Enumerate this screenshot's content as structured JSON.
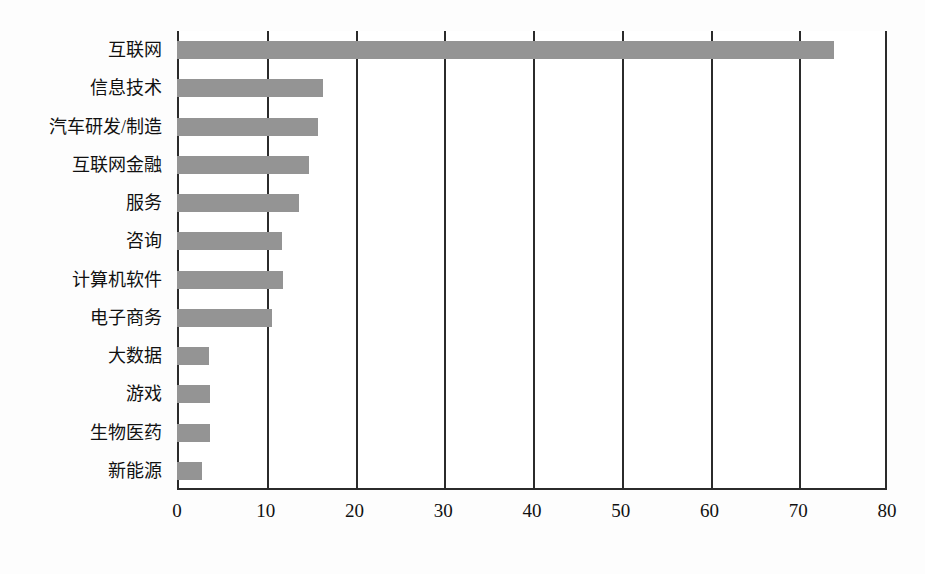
{
  "chart_data": {
    "type": "bar",
    "orientation": "horizontal",
    "title": "",
    "xlabel": "",
    "ylabel": "",
    "xlim": [
      0,
      80
    ],
    "ylim": null,
    "grid": true,
    "legend": null,
    "bar_color": "#949494",
    "axis_color": "#2b2b2b",
    "background_color": "#ffffff",
    "xticks": [
      0,
      10,
      20,
      30,
      40,
      50,
      60,
      70,
      80
    ],
    "xtick_labels": [
      "0",
      "10",
      "20",
      "30",
      "40",
      "50",
      "60",
      "70",
      "80"
    ],
    "categories": [
      "互联网",
      "信息技术",
      "汽车研发/制造",
      "互联网金融",
      "服务",
      "咨询",
      "计算机软件",
      "电子商务",
      "大数据",
      "游戏",
      "生物医药",
      "新能源"
    ],
    "values": [
      74,
      16.5,
      15.9,
      14.9,
      13.7,
      11.8,
      11.9,
      10.7,
      3.6,
      3.7,
      3.7,
      2.8
    ]
  }
}
